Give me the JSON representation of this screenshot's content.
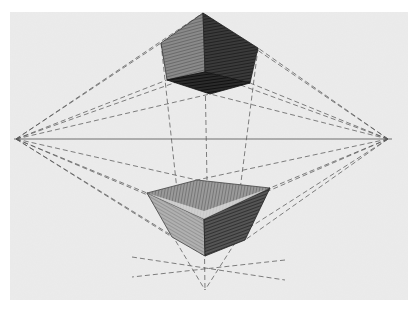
{
  "image": {
    "title": "Three-point perspective pencil sketch of two cubes",
    "description": "Pencil drawing on paper: a cube seen from below (top) and a cube seen from above (bottom), both constructed with dashed construction lines to a left vanishing point, a right vanishing point, and a lower vanishing point, with a horizon line."
  },
  "colors": {
    "margin": "#ffffff",
    "paper": "#ececec",
    "graphite_dark": "#2a2a2a",
    "graphite_mid": "#6b6b6b",
    "graphite_light": "#a9a9a9",
    "line": "#5a5a5a"
  },
  "geometry": {
    "paper": {
      "x": 10,
      "y": 12,
      "w": 398,
      "h": 288
    },
    "horizon_y": 139,
    "vp_left": [
      16,
      139
    ],
    "vp_right": [
      388,
      139
    ],
    "vp_bottom": [
      205,
      290
    ],
    "top_cube": {
      "apex": [
        203,
        13
      ],
      "left_top": [
        161,
        43
      ],
      "right_top": [
        258,
        48
      ],
      "left_bottom": [
        167,
        80
      ],
      "front_bottom": [
        205,
        72
      ],
      "right_bottom": [
        250,
        83
      ],
      "back_bottom": [
        210,
        94
      ]
    },
    "bottom_cube": {
      "top_back": [
        197,
        180
      ],
      "top_left": [
        147,
        193
      ],
      "top_right": [
        270,
        188
      ],
      "top_front": [
        204,
        219
      ],
      "bottom_left": [
        172,
        237
      ],
      "bottom_front": [
        205,
        256
      ],
      "bottom_right": [
        245,
        240
      ]
    }
  }
}
